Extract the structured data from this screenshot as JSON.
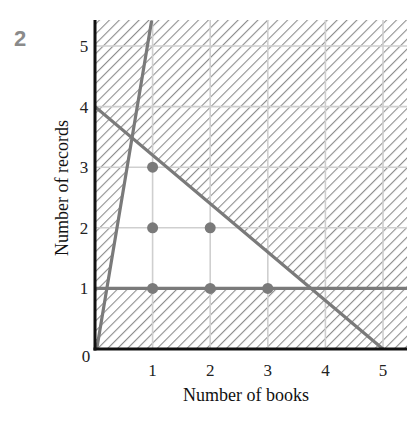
{
  "figure_number": "2",
  "chart_data": {
    "type": "scatter",
    "title": "",
    "xlabel": "Number of books",
    "ylabel": "Number of records",
    "xlim": [
      0,
      5.4
    ],
    "ylim": [
      0,
      5.4
    ],
    "x_ticks": [
      "1",
      "2",
      "3",
      "4",
      "5"
    ],
    "y_ticks": [
      "1",
      "2",
      "3",
      "4",
      "5"
    ],
    "origin_label": "0",
    "grid": true,
    "constraint_lines": [
      {
        "name": "y = 1",
        "from": [
          0,
          1
        ],
        "to": [
          5.4,
          1
        ]
      },
      {
        "name": "4x + 5y = 20",
        "from": [
          0,
          4
        ],
        "to": [
          5,
          0
        ]
      },
      {
        "name": "y = 6x (steep)",
        "from": [
          0.03,
          0
        ],
        "to": [
          0.98,
          5.4
        ]
      }
    ],
    "feasible_region": "unshaded triangle bounded by y=1, 4x+5y=20 and the steep line; everything else hatched",
    "points": [
      {
        "x": 1,
        "y": 1
      },
      {
        "x": 2,
        "y": 1
      },
      {
        "x": 3,
        "y": 1
      },
      {
        "x": 1,
        "y": 2
      },
      {
        "x": 2,
        "y": 2
      },
      {
        "x": 1,
        "y": 3
      }
    ],
    "colors": {
      "lines": "#7a7a7a",
      "points": "#7a7a7a",
      "grid": "#cfcfcf",
      "hatch": "#9a9a9a",
      "axes": "#111111"
    }
  }
}
